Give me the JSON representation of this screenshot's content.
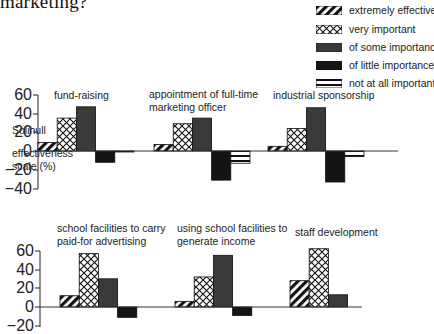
{
  "title": "marketing?",
  "region": "Solihull",
  "y_label_line1": "effectiveness",
  "y_label_line2": "scale (%)",
  "legend": [
    {
      "key": "extremely",
      "label": "extremely effective",
      "pattern": "diagonal-stripes"
    },
    {
      "key": "very",
      "label": "very important",
      "pattern": "crosshatch"
    },
    {
      "key": "some",
      "label": "of some importance",
      "pattern": "dark-grey"
    },
    {
      "key": "little",
      "label": "of little importance",
      "pattern": "black"
    },
    {
      "key": "not",
      "label": "not at all important",
      "pattern": "horizontal-stripes"
    }
  ],
  "top_ticks": [
    "60",
    "40",
    "20",
    "0",
    "−20",
    "−40"
  ],
  "bottom_ticks": [
    "60",
    "40",
    "20",
    "0",
    "−20"
  ],
  "panel_titles": {
    "p1": "fund-raising",
    "p2_l1": "appointment of full-time",
    "p2_l2": "marketing officer",
    "p3": "industrial sponsorship",
    "p4_l1": "school facilities to carry",
    "p4_l2": "paid-for advertising",
    "p5_l1": "using school facilities to",
    "p5_l2": "generate income",
    "p6": "staff development"
  },
  "chart_data": {
    "type": "bar",
    "title": "marketing?",
    "subtitle": "Solihull",
    "ylabel": "effectiveness scale (%)",
    "series_names": [
      "extremely effective",
      "very important",
      "of some importance",
      "of little importance",
      "not at all important"
    ],
    "legend_position": "top-right",
    "grid": false,
    "panels": [
      {
        "category": "fund-raising",
        "ylim": [
          -40,
          60
        ],
        "values": [
          9,
          35,
          47,
          -12,
          -1
        ]
      },
      {
        "category": "appointment of full-time marketing officer",
        "ylim": [
          -40,
          60
        ],
        "values": [
          7,
          29,
          35,
          -31,
          -13
        ]
      },
      {
        "category": "industrial sponsorship",
        "ylim": [
          -40,
          60
        ],
        "values": [
          5,
          24,
          46,
          -33,
          -6
        ]
      },
      {
        "category": "school facilities to carry paid-for advertising",
        "ylim": [
          -20,
          60
        ],
        "values": [
          12,
          57,
          30,
          -11,
          0
        ]
      },
      {
        "category": "using school facilities to generate income",
        "ylim": [
          -20,
          60
        ],
        "values": [
          6,
          32,
          55,
          -9,
          0
        ]
      },
      {
        "category": "staff development",
        "ylim": [
          -20,
          60
        ],
        "values": [
          28,
          62,
          13,
          0,
          0
        ]
      }
    ]
  }
}
